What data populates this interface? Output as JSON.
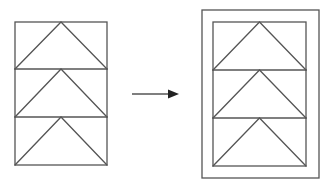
{
  "diagram": {
    "stroke_color": "#555555",
    "background": "#ffffff",
    "left_figure": {
      "label": "original",
      "rect": {
        "x": 15,
        "y": 22,
        "w": 92,
        "h": 143
      },
      "cells": 3,
      "dividers_y": [
        69,
        117
      ]
    },
    "arrow": {
      "x1": 132,
      "y1": 94,
      "x2": 178,
      "y2": 94,
      "direction": "right"
    },
    "right_figure": {
      "label": "framed",
      "outer_rect": {
        "x": 202,
        "y": 10,
        "w": 117,
        "h": 168
      },
      "inner_rect": {
        "x": 213,
        "y": 22,
        "w": 93,
        "h": 144
      },
      "cells": 3,
      "dividers_y": [
        70,
        118
      ]
    }
  }
}
